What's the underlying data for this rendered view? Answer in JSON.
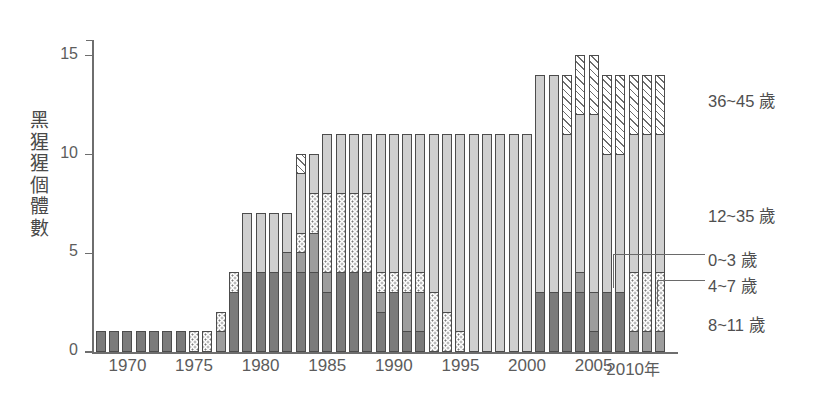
{
  "chart_data": {
    "type": "bar",
    "stacked": true,
    "title": "",
    "xlabel": "年",
    "ylabel": "黑猩猩個體數",
    "ylim": [
      0,
      15.8
    ],
    "yticks": [
      0,
      5,
      10,
      15
    ],
    "ytick_labels": [
      "0",
      "5",
      "10",
      "15"
    ],
    "xticks": [
      1970,
      1975,
      1980,
      1985,
      1990,
      1995,
      2000,
      2005,
      2010
    ],
    "xtick_labels": [
      "1970",
      "1975",
      "1980",
      "1985",
      "1990",
      "1995",
      "2000",
      "2005",
      "2010"
    ],
    "x_axis_unit_label": "年",
    "grid": false,
    "legend_position": "right",
    "categories": [
      1968,
      1969,
      1970,
      1971,
      1972,
      1973,
      1974,
      1975,
      1976,
      1977,
      1978,
      1979,
      1980,
      1981,
      1982,
      1983,
      1984,
      1985,
      1986,
      1987,
      1988,
      1989,
      1990,
      1991,
      1992,
      1993,
      1994,
      1995,
      1996,
      1997,
      1998,
      1999,
      2000,
      2001,
      2002,
      2003,
      2004,
      2005,
      2006,
      2007,
      2008,
      2009,
      2010
    ],
    "series": [
      {
        "name": "8~11 歲",
        "fill": "dark-gray",
        "color": "#7b7b7b",
        "values": [
          1,
          1,
          1,
          1,
          1,
          1,
          1,
          0,
          0,
          0,
          3,
          4,
          4,
          4,
          4,
          4,
          4,
          3,
          4,
          4,
          4,
          2,
          3,
          1,
          1,
          0,
          0,
          0,
          0,
          0,
          0,
          0,
          0,
          3,
          3,
          3,
          3,
          1,
          3,
          3,
          0,
          0,
          0
        ]
      },
      {
        "name": "4~7 歲",
        "fill": "medium-gray",
        "color": "#9d9d9d",
        "values": [
          0,
          0,
          0,
          0,
          0,
          0,
          0,
          0,
          0,
          1,
          0,
          0,
          0,
          0,
          1,
          1,
          2,
          1,
          0,
          0,
          0,
          1,
          0,
          2,
          2,
          0,
          0,
          0,
          0,
          0,
          0,
          0,
          0,
          0,
          0,
          0,
          1,
          2,
          0,
          0,
          1,
          1,
          1
        ]
      },
      {
        "name": "0~3 歲",
        "fill": "dotted",
        "color": "#fdfdfd",
        "values": [
          0,
          0,
          0,
          0,
          0,
          0,
          0,
          1,
          1,
          1,
          1,
          0,
          0,
          0,
          0,
          1,
          2,
          4,
          4,
          4,
          4,
          1,
          1,
          1,
          1,
          3,
          2,
          1,
          0,
          0,
          0,
          0,
          0,
          0,
          0,
          0,
          0,
          0,
          0,
          0,
          3,
          3,
          3
        ]
      },
      {
        "name": "12~35 歲",
        "fill": "light-gray",
        "color": "#cfcfcf",
        "values": [
          0,
          0,
          0,
          0,
          0,
          0,
          0,
          0,
          0,
          0,
          0,
          3,
          3,
          3,
          2,
          3,
          2,
          3,
          3,
          3,
          3,
          7,
          7,
          7,
          7,
          8,
          9,
          10,
          11,
          11,
          11,
          11,
          11,
          11,
          11,
          8,
          8,
          9,
          7,
          7,
          7,
          7,
          7
        ]
      },
      {
        "name": "36~45 歲",
        "fill": "diagonal-hatch",
        "color": "#ffffff",
        "values": [
          0,
          0,
          0,
          0,
          0,
          0,
          0,
          0,
          0,
          0,
          0,
          0,
          0,
          0,
          0,
          1,
          0,
          0,
          0,
          0,
          0,
          0,
          0,
          0,
          0,
          0,
          0,
          0,
          0,
          0,
          0,
          0,
          0,
          0,
          0,
          3,
          3,
          3,
          4,
          4,
          3,
          3,
          3
        ]
      }
    ],
    "totals": [
      1,
      1,
      1,
      1,
      1,
      1,
      1,
      1,
      1,
      2,
      4,
      7,
      7,
      7,
      7,
      9,
      10,
      11,
      11,
      11,
      11,
      11,
      11,
      11,
      11,
      11,
      11,
      11,
      11,
      11,
      11,
      11,
      11,
      14,
      14,
      14,
      15,
      15,
      14,
      14,
      14,
      14,
      14
    ]
  },
  "legend": {
    "items": [
      {
        "label": "36~45 歲",
        "fill": "diagonal-hatch"
      },
      {
        "label": "12~35 歲",
        "fill": "light-gray"
      },
      {
        "label": "0~3 歲",
        "fill": "dotted"
      },
      {
        "label": "4~7 歲",
        "fill": "medium-gray"
      },
      {
        "label": "8~11 歲",
        "fill": "dark-gray"
      }
    ]
  },
  "axes": {
    "y_title_chars": [
      "黑",
      "猩",
      "猩",
      "個",
      "體",
      "數"
    ],
    "y_labels": [
      "15",
      "10",
      "5",
      "0"
    ],
    "x_labels": [
      "1970",
      "1975",
      "1980",
      "1985",
      "1990",
      "1995",
      "2000",
      "2005",
      "2010"
    ],
    "x_unit": "年"
  },
  "colors": {
    "axis": "#6e6e6e",
    "text": "#5a5a5a",
    "dark_gray": "#7b7b7b",
    "medium_gray": "#9d9d9d",
    "light_gray": "#cfcfcf",
    "dotted_bg": "#fdfdfd",
    "hatch_line": "#6d6d6d"
  }
}
